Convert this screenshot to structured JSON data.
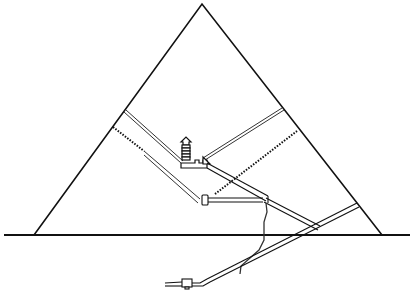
{
  "diagram": {
    "title": "",
    "type": "pyramid-cross-section",
    "colors": {
      "background": "#ffffff",
      "line": "#111111",
      "passage": "#333333"
    },
    "elements": [
      {
        "id": "ground-line",
        "label": ""
      },
      {
        "id": "pyramid-outline",
        "label": ""
      },
      {
        "id": "descending-passage",
        "label": ""
      },
      {
        "id": "subterranean-chamber",
        "label": ""
      },
      {
        "id": "ascending-passage",
        "label": ""
      },
      {
        "id": "grand-gallery",
        "label": ""
      },
      {
        "id": "kings-chamber",
        "label": ""
      },
      {
        "id": "relieving-chambers",
        "label": ""
      },
      {
        "id": "queens-chamber",
        "label": ""
      },
      {
        "id": "well-shaft",
        "label": ""
      },
      {
        "id": "air-shafts-kings",
        "label": ""
      },
      {
        "id": "air-shafts-queens",
        "label": ""
      }
    ]
  }
}
